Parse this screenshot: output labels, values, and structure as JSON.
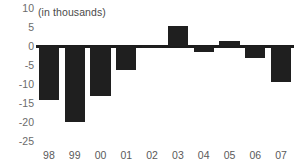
{
  "chart_data": {
    "type": "bar",
    "title": "",
    "subtitle": "(in thousands)",
    "xlabel": "",
    "ylabel": "",
    "categories": [
      "98",
      "99",
      "00",
      "01",
      "02",
      "03",
      "04",
      "05",
      "06",
      "07"
    ],
    "values": [
      -14.2,
      -20.0,
      -13.2,
      -6.3,
      -0.3,
      5.2,
      -1.5,
      1.2,
      -3.2,
      -9.6
    ],
    "ylim": [
      -25,
      10
    ],
    "yticks": [
      10,
      5,
      0,
      -5,
      -10,
      -15,
      -20,
      -25
    ],
    "ytick_labels": [
      "10",
      "5",
      "0",
      "-5",
      "-10",
      "-15",
      "-20",
      "-25"
    ],
    "grid": false,
    "legend": null,
    "bar_color": "#1f1f1f",
    "axis_color": "#1c1c1c",
    "tick_label_color": "#6b6b6b",
    "background_color": "#ffffff"
  }
}
